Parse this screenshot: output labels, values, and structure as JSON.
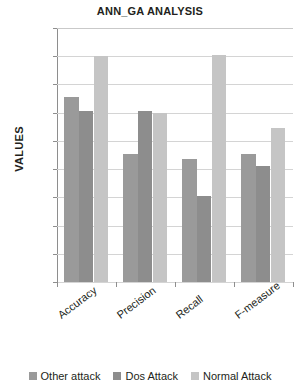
{
  "chart_data": {
    "type": "bar",
    "title": "ANN_GA ANALYSIS",
    "xlabel": "PARAMETERS",
    "ylabel": "VALUES",
    "categories": [
      "Accuracy",
      "Precision",
      "Recall",
      "F-measure"
    ],
    "series": [
      {
        "name": "Other attack",
        "color": "#9a9a9a",
        "values": [
          91.1,
          87.1,
          86.7,
          87.1
        ]
      },
      {
        "name": "Dos Attack",
        "color": "#8d8d8d",
        "values": [
          90.1,
          90.1,
          84.1,
          86.2
        ]
      },
      {
        "name": "Normal Attack",
        "color": "#c5c5c5",
        "values": [
          94.0,
          90.0,
          94.1,
          88.9
        ]
      }
    ],
    "ylim": [
      78,
      96
    ],
    "ytick_step": 2,
    "yticks": [
      96,
      94,
      92,
      90,
      88,
      86,
      84,
      82,
      80,
      78
    ],
    "grid": true,
    "legend_position": "bottom"
  }
}
